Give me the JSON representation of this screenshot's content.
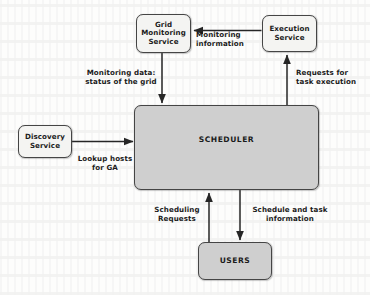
{
  "diagram": {
    "background_color": "#fdfdfc",
    "node_fill_light": "#f4f4f2",
    "node_fill_gray": "#cfcfcf",
    "stroke_color": "#454545",
    "text_color": "#1b1b1b",
    "nodes": [
      {
        "id": "grid-monitoring-service",
        "label": "Grid\nMonitoring\nService",
        "style": "small"
      },
      {
        "id": "execution-service",
        "label": "Execution\nService",
        "style": "small"
      },
      {
        "id": "discovery-service",
        "label": "Discovery\nService",
        "style": "small"
      },
      {
        "id": "scheduler",
        "label": "SCHEDULER",
        "style": "big"
      },
      {
        "id": "users",
        "label": "USERS",
        "style": "big"
      }
    ],
    "edges": [
      {
        "id": "monitoring-information",
        "label": "Monitoring\ninformation",
        "from": "execution-service",
        "to": "grid-monitoring-service",
        "direction": "left"
      },
      {
        "id": "monitoring-data",
        "label": "Monitoring data:\nstatus of the grid",
        "from": "grid-monitoring-service",
        "to": "scheduler",
        "direction": "down"
      },
      {
        "id": "requests-for-task-execution",
        "label": "Requests for\ntask execution",
        "from": "scheduler",
        "to": "execution-service",
        "direction": "up"
      },
      {
        "id": "lookup-hosts-for-ga",
        "label": "Lookup hosts\nfor GA",
        "from": "discovery-service",
        "to": "scheduler",
        "direction": "right"
      },
      {
        "id": "scheduling-requests",
        "label": "Scheduling\nRequests",
        "from": "users",
        "to": "scheduler",
        "direction": "up"
      },
      {
        "id": "schedule-and-task-information",
        "label": "Schedule and task\ninformation",
        "from": "scheduler",
        "to": "users",
        "direction": "down"
      }
    ]
  }
}
